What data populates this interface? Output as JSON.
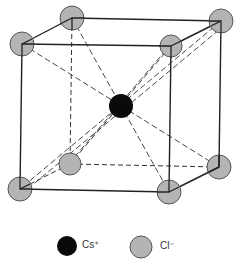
{
  "atoms": {
    "corner": [
      {
        "id": "front-top-left",
        "x": 22,
        "y": 44
      },
      {
        "id": "front-top-right",
        "x": 171,
        "y": 46
      },
      {
        "id": "back-top-left",
        "x": 72,
        "y": 18
      },
      {
        "id": "back-top-right",
        "x": 221,
        "y": 21
      },
      {
        "id": "front-bottom-left",
        "x": 20,
        "y": 189
      },
      {
        "id": "front-bottom-right",
        "x": 169,
        "y": 192
      },
      {
        "id": "back-bottom-left",
        "x": 70,
        "y": 164
      },
      {
        "id": "back-bottom-right",
        "x": 219,
        "y": 167
      }
    ],
    "center": {
      "id": "body-center",
      "x": 121,
      "y": 106
    }
  },
  "legend": {
    "cation": {
      "label": "Cs⁺",
      "color": "#0a0a0a"
    },
    "anion": {
      "label": "Cl⁻",
      "color": "#b4b4b4"
    }
  },
  "colors": {
    "edge": "#222222",
    "corner_fill": "#b4b4b4",
    "corner_stroke": "#555555",
    "center_fill": "#0a0a0a"
  }
}
